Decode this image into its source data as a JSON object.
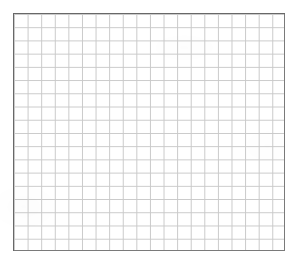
{
  "canvas": {
    "width": 297,
    "height": 265,
    "background_color": "#ffffff",
    "label": "blank-grid-canvas"
  },
  "grid": {
    "label": "empty grid",
    "x": 13,
    "y": 13,
    "width": 272,
    "height": 238,
    "columns": 20,
    "rows": 18,
    "cell_width": 13.6,
    "cell_height": 13.2,
    "cell_line_color": "#c9c9c9",
    "cell_line_width": 1,
    "border_color": "#7a7a7a",
    "border_width": 1,
    "fill_color": "#ffffff",
    "has_labels": false,
    "has_axis_ticks": false,
    "content": ""
  },
  "chart_data": {
    "type": "table",
    "title": "",
    "xlabel": "",
    "ylabel": "",
    "categories": [],
    "values": [],
    "series": [],
    "grid": true,
    "legend": "none",
    "note": "Empty graph-paper grid: 20 columns by 18 rows, no plotted data, no tick labels, no annotations."
  }
}
